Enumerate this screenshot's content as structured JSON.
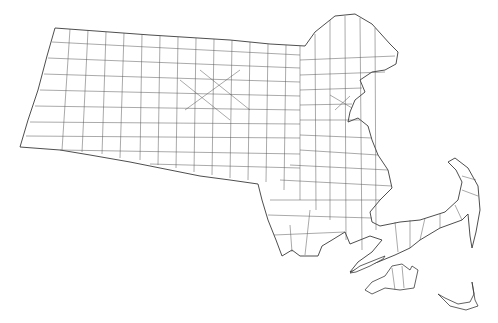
{
  "map": {
    "subject": "Massachusetts town boundaries",
    "style": "line-drawing outline map",
    "colors": {
      "background": "#ffffff",
      "line": "#3a3a3a"
    },
    "labels": []
  }
}
